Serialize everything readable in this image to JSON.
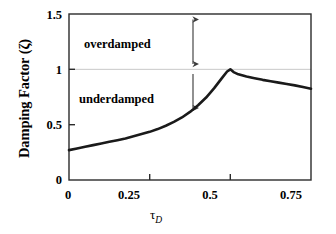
{
  "chart_data": {
    "type": "line",
    "title": "",
    "xlabel": "τD",
    "xlabel_base": "τ",
    "xlabel_sub": "D",
    "ylabel": "Damping Factor (ζ)",
    "xlim": [
      0,
      0.75
    ],
    "ylim": [
      0,
      1.5
    ],
    "xticks": [
      "0",
      "0.25",
      "0.5",
      "0.75"
    ],
    "xtick_values": [
      0,
      0.25,
      0.5,
      0.75
    ],
    "yticks": [
      "0",
      "0.5",
      "1",
      "1.5"
    ],
    "ytick_values": [
      0,
      0.5,
      1,
      1.5
    ],
    "grid": "horizontal gridline at y = 1 only",
    "gridlines_y": [
      1
    ],
    "legend": "none",
    "line_color": "#1a1a1a",
    "line_width_px": 2.6,
    "gridline_color": "#c8c8c8",
    "axis_color": "#2b2b2b",
    "series": [
      {
        "name": "Damping factor vs tau_D",
        "x": [
          0.0,
          0.025,
          0.05,
          0.075,
          0.1,
          0.125,
          0.15,
          0.175,
          0.2,
          0.225,
          0.25,
          0.275,
          0.3,
          0.325,
          0.35,
          0.375,
          0.4,
          0.425,
          0.45,
          0.475,
          0.49,
          0.5,
          0.51,
          0.525,
          0.55,
          0.575,
          0.6,
          0.625,
          0.65,
          0.675,
          0.7,
          0.725,
          0.75
        ],
        "y": [
          0.27,
          0.285,
          0.3,
          0.315,
          0.33,
          0.345,
          0.36,
          0.375,
          0.395,
          0.415,
          0.435,
          0.46,
          0.49,
          0.525,
          0.565,
          0.615,
          0.675,
          0.745,
          0.83,
          0.925,
          0.98,
          1.0,
          0.975,
          0.955,
          0.935,
          0.92,
          0.905,
          0.893,
          0.88,
          0.868,
          0.855,
          0.84,
          0.825
        ]
      }
    ],
    "annotations": [
      {
        "name": "overdamped",
        "text": "overdamped",
        "text_x": 0.155,
        "text_y": 1.26,
        "arrow": {
          "type": "double-headed",
          "x": 0.385,
          "y_from": 1.5,
          "y_to": 1.0
        }
      },
      {
        "name": "underdamped",
        "text": "underdamped",
        "text_x": 0.165,
        "text_y": 0.8,
        "arrow": {
          "type": "single-headed-down",
          "x": 0.385,
          "y_from": 1.0,
          "y_to": 0.6
        }
      }
    ]
  }
}
